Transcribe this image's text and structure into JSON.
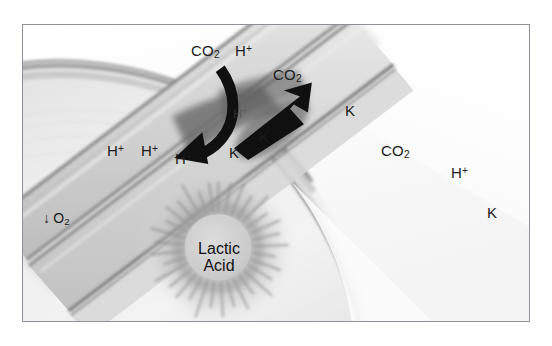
{
  "figure": {
    "border_color": "#8d9096",
    "background_color": "#ffffff",
    "ink_color": "#1b1b1b"
  },
  "labels": {
    "co2_top": {
      "text": "CO",
      "sub": "2"
    },
    "h_top": {
      "text": "H",
      "sup": "+"
    },
    "co2_arrow": {
      "text": "CO",
      "sub": "2"
    },
    "h_left_1": {
      "text": "H",
      "sup": "+"
    },
    "h_left_2": {
      "text": "H",
      "sup": "+"
    },
    "h_left_3": {
      "text": "H",
      "sup": "+"
    },
    "h_faint_mid": {
      "text": "H",
      "sup": "+"
    },
    "k_mid_low": {
      "text": "K"
    },
    "k_mid_high": {
      "text": "K"
    },
    "k_vessel_upper": {
      "text": "K"
    },
    "co2_vessel": {
      "text": "CO",
      "sub": "2"
    },
    "h_vessel": {
      "text": "H",
      "sup": "+"
    },
    "k_vessel_lower": {
      "text": "K"
    },
    "o2_down": {
      "arrow": "↓",
      "text": "O",
      "sub": "2"
    },
    "lactic_acid": {
      "line1": "Lactic",
      "line2": "Acid"
    }
  },
  "annotations": {
    "curved_arrow": {
      "name": "curved-arrow-h-efflux",
      "description": "curved black arrow sweeping from the capillary down-left into the muscle tissue",
      "color": "#101010"
    },
    "straight_arrow": {
      "name": "straight-arrow-co2-influx",
      "description": "solid black triangular arrow pointing up-right into the capillary",
      "color": "#101010"
    }
  },
  "anatomy": {
    "capillary": {
      "name": "capillary-vessel",
      "orientation": "diagonal from lower-left to upper-right",
      "wall_color": "#8b8b8b",
      "lumen_color": "#d8d8d8"
    },
    "muscle_fiber": {
      "name": "muscle-fiber-mass",
      "description": "large pale curved muscle body occupying the left and lower portion",
      "color": "#eeeeee"
    },
    "lactic_acid_burst": {
      "name": "lactic-acid-starburst",
      "core_color": "#cfcfcf",
      "spike_color": "#9a9a9a"
    }
  }
}
